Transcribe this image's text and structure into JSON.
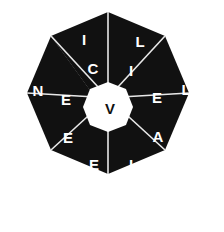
{
  "puzzle": {
    "title": "Octagon Word Wheel",
    "shape": "octagon",
    "segment_count": 8,
    "colors": {
      "background": "#ffffff",
      "segment_fill": "#111111",
      "divider": "#e8e8e8",
      "letter": "#ffffff",
      "center_fill": "#ffffff",
      "center_letter": "#111111"
    },
    "center": {
      "letter": "V"
    },
    "segments": [
      {
        "id": "segment-n",
        "position": "top-left",
        "inner_letter": "C",
        "outer_letter": "I"
      },
      {
        "id": "segment-ne",
        "position": "top-right",
        "inner_letter": "I",
        "outer_letter": "L"
      },
      {
        "id": "segment-e",
        "position": "right-upper",
        "inner_letter": "E",
        "outer_letter": "L"
      },
      {
        "id": "segment-se",
        "position": "right-lower",
        "inner_letter": "A",
        "outer_letter": "H"
      },
      {
        "id": "segment-s",
        "position": "bottom-right",
        "inner_letter": "I",
        "outer_letter": "C"
      },
      {
        "id": "segment-sw",
        "position": "bottom-left",
        "inner_letter": "E",
        "outer_letter": "D"
      },
      {
        "id": "segment-w",
        "position": "left-lower",
        "inner_letter": "E",
        "outer_letter": "R"
      },
      {
        "id": "segment-nw",
        "position": "left-upper",
        "inner_letter": "E",
        "outer_letter": "N"
      }
    ],
    "letters_inner_clockwise": [
      "C",
      "I",
      "E",
      "A",
      "I",
      "E",
      "E",
      "E"
    ],
    "letters_outer_clockwise": [
      "I",
      "L",
      "L",
      "H",
      "C",
      "D",
      "R",
      "N"
    ]
  },
  "geometry": {
    "outer_points": "108,12 164,35 187,91 164,147 108,170 52,147 29,91 52,35",
    "outer_points_full": "108,12 165,36 189,93 165,150 108,174 51,150 27,93 51,36",
    "center_points": "108,85 117,88 121,97 117,106 108,110 99,106 95,97 99,88",
    "letter_positions": {
      "top_left_outer": [
        84,
        39
      ],
      "top_left_inner": [
        93,
        68
      ],
      "top_right_outer": [
        140,
        41
      ],
      "top_right_inner": [
        130,
        70
      ],
      "right_upper_outer": [
        185,
        89
      ],
      "right_upper_inner": [
        157,
        97
      ],
      "right_lower_outer": [
        186,
        148
      ],
      "right_lower_inner": [
        158,
        136
      ],
      "bottom_right_outer": [
        141,
        192
      ],
      "bottom_right_inner": [
        131,
        164
      ],
      "bottom_left_outer": [
        85,
        192
      ],
      "bottom_left_inner": [
        94,
        164
      ],
      "left_lower_outer": [
        38,
        150
      ],
      "left_lower_inner": [
        68,
        137
      ],
      "left_upper_outer": [
        38,
        90
      ],
      "left_upper_inner": [
        66,
        99
      ],
      "center": [
        110,
        119
      ]
    }
  }
}
